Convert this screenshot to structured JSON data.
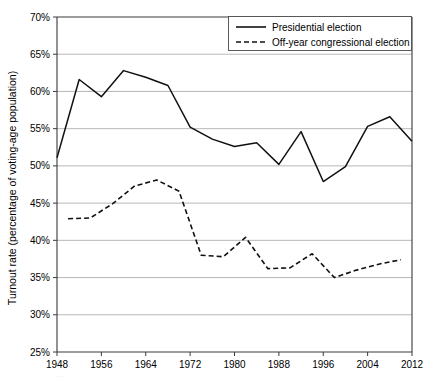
{
  "chart_data": {
    "type": "line",
    "title": "",
    "xlabel": "",
    "ylabel": "Turnout rate (percentage of voting-age population)",
    "xlim": [
      1948,
      2012
    ],
    "ylim": [
      25,
      70
    ],
    "grid": true,
    "y_tick_labels": [
      "70%",
      "65%",
      "60%",
      "55%",
      "50%",
      "45%",
      "40%",
      "35%",
      "30%",
      "25%"
    ],
    "y_tick_values": [
      70,
      65,
      60,
      55,
      50,
      45,
      40,
      35,
      30,
      25
    ],
    "x_tick_labels": [
      "1948",
      "1956",
      "1964",
      "1972",
      "1980",
      "1988",
      "1996",
      "2004",
      "2012"
    ],
    "x_tick_values": [
      1948,
      1956,
      1964,
      1972,
      1980,
      1988,
      1996,
      2004,
      2012
    ],
    "legend_position": "top-right",
    "series": [
      {
        "name": "Presidential election",
        "style": "solid",
        "color": "#111111",
        "x": [
          1948,
          1952,
          1956,
          1960,
          1964,
          1968,
          1972,
          1976,
          1980,
          1984,
          1988,
          1992,
          1996,
          2000,
          2004,
          2008,
          2012
        ],
        "values": [
          51.1,
          61.6,
          59.3,
          62.8,
          61.9,
          60.8,
          55.2,
          53.6,
          52.6,
          53.1,
          50.2,
          54.6,
          47.9,
          49.9,
          55.3,
          56.6,
          53.3
        ]
      },
      {
        "name": "Off-year congressional election",
        "style": "dashed",
        "color": "#111111",
        "x": [
          1950,
          1954,
          1958,
          1962,
          1966,
          1970,
          1974,
          1978,
          1982,
          1986,
          1990,
          1994,
          1998,
          2002,
          2006,
          2010
        ],
        "values": [
          42.9,
          43.0,
          44.9,
          47.3,
          48.1,
          46.6,
          38.0,
          37.8,
          40.4,
          36.2,
          36.3,
          38.2,
          35.0,
          36.0,
          36.8,
          37.4
        ]
      }
    ]
  },
  "legend": {
    "items": [
      {
        "label": "Presidential election",
        "style": "solid"
      },
      {
        "label": "Off-year congressional election",
        "style": "dashed"
      }
    ]
  },
  "axes": {
    "y_title": "Turnout rate (percentage of voting-age population)"
  }
}
